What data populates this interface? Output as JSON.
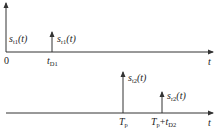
{
  "diagram": {
    "colors": {
      "line": "#333333",
      "text": "#222222",
      "background": "#ffffff"
    },
    "top_panel": {
      "origin_label": "0",
      "time_axis_label": "t",
      "impulses": [
        {
          "name": "s",
          "sub": "t1",
          "suffix": "(t)",
          "position_label": ""
        },
        {
          "name": "s",
          "sub": "r1",
          "suffix": "(t)",
          "position_label_main": "t",
          "position_label_sub": "D1"
        }
      ]
    },
    "bottom_panel": {
      "time_axis_label": "t",
      "impulses": [
        {
          "name": "s",
          "sub": "t2",
          "suffix": "(t)",
          "position_label_main": "T",
          "position_label_sub": "p"
        },
        {
          "name": "s",
          "sub": "r2",
          "suffix": "(t)",
          "position_label_main": "T",
          "position_label_sub": "p",
          "position_label_plus": "+",
          "position_label_main2": "t",
          "position_label_sub2": "D2"
        }
      ]
    }
  }
}
